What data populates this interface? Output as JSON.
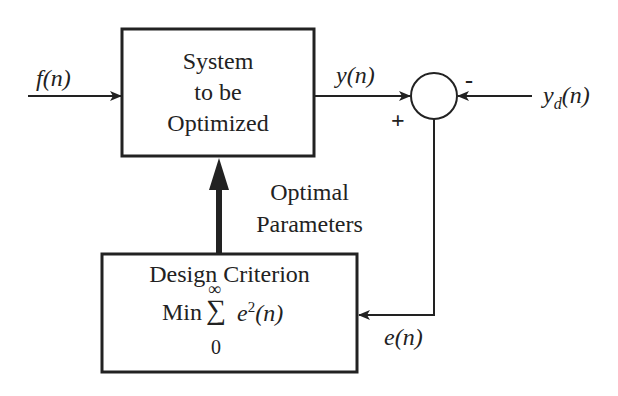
{
  "system_block": {
    "line1": "System",
    "line2": "to be",
    "line3": "Optimized"
  },
  "criterion_block": {
    "title": "Design Criterion",
    "min": "Min",
    "sum_symbol": "∑",
    "upper": "∞",
    "lower": "0",
    "term": "e",
    "exponent": "2",
    "arg": "(n)"
  },
  "signals": {
    "input": {
      "name": "f",
      "arg": "(n)"
    },
    "output": {
      "name": "y",
      "arg": "(n)"
    },
    "desired": {
      "name": "y",
      "sub": "d",
      "arg": "(n)"
    },
    "error": {
      "name": "e",
      "arg": "(n)"
    }
  },
  "summing_junction": {
    "plus": "+",
    "minus": "-"
  },
  "parameters_label": {
    "line1": "Optimal",
    "line2": "Parameters"
  }
}
